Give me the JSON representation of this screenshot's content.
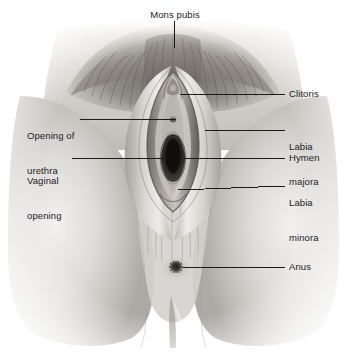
{
  "figure": {
    "style": "grayscale medical illustration",
    "background_color": "#ffffff",
    "leader_line_color": "#1b1b1b",
    "text_color": "#1b1b1b"
  },
  "labels": {
    "mons_pubis": "Mons pubis",
    "clitoris": "Clitoris",
    "labia_majora_line1": "Labia",
    "labia_majora_line2": "majora",
    "hymen": "Hymen",
    "labia_minora_line1": "Labia",
    "labia_minora_line2": "minora",
    "anus": "Anus",
    "opening_of_urethra_line1": "Opening of",
    "opening_of_urethra_line2": "urethra",
    "vaginal_opening_line1": "Vaginal",
    "vaginal_opening_line2": "opening"
  }
}
